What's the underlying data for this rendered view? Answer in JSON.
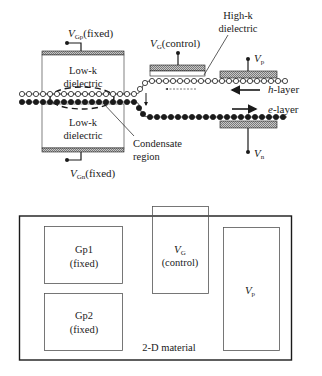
{
  "cross_section": {
    "top_gate": {
      "symbol": "V",
      "subscript": "Gp",
      "suffix": "(fixed)"
    },
    "bottom_gate": {
      "symbol": "V",
      "subscript": "Gn",
      "suffix": "(fixed)"
    },
    "top_dielectric": {
      "line1": "Low-k",
      "line2": "dielectric"
    },
    "bottom_dielectric": {
      "line1": "Low-k",
      "line2": "dielectric"
    },
    "control_gate": {
      "symbol": "V",
      "subscript": "G",
      "suffix": "(control)"
    },
    "high_k": {
      "line1": "High-k",
      "line2": "dielectric"
    },
    "p_contact": {
      "symbol": "V",
      "subscript": "p"
    },
    "n_contact": {
      "symbol": "V",
      "subscript": "n"
    },
    "h_layer": {
      "prefix": "h",
      "suffix": "-layer"
    },
    "e_layer": {
      "prefix": "e",
      "suffix": "-layer"
    },
    "condensate": {
      "line1": "Condensate",
      "line2": "region"
    }
  },
  "plan_view": {
    "material_label": "2-D material",
    "gp1": {
      "line1": "Gp1",
      "line2": "(fixed)"
    },
    "gp2": {
      "line1": "Gp2",
      "line2": "(fixed)"
    },
    "vg": {
      "symbol": "V",
      "subscript": "G",
      "line2": "(control)"
    },
    "vp": {
      "symbol": "V",
      "subscript": "p"
    }
  },
  "colors": {
    "ink": "#1a1a1a",
    "hatch": "#9a9a9a",
    "background": "#ffffff"
  }
}
